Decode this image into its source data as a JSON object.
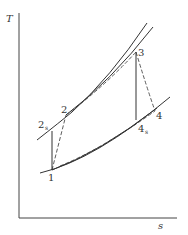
{
  "diagram": {
    "type": "T-s diagram",
    "axes": {
      "y_label": "T",
      "x_label": "s"
    },
    "points": {
      "p1": "1",
      "p2": "2",
      "p2s": "2",
      "p2s_sub": "s",
      "p3": "3",
      "p4": "4",
      "p4s": "4",
      "p4s_sub": "s"
    },
    "curves": [
      "high-pressure isobar (outer)",
      "high-pressure isobar (inner)",
      "low-pressure isobar (outer)",
      "low-pressure isobar (inner)",
      "isentropic compression 1-2s",
      "actual compression 1-2 (dashed)",
      "isentropic expansion 3-4s",
      "actual expansion 3-4 (dashed)"
    ],
    "colors": {
      "line": "#333333",
      "background": "#ffffff"
    }
  }
}
